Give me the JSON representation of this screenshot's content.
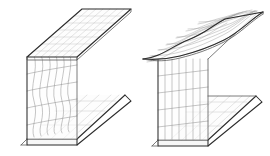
{
  "figure": {
    "background_color": "#ffffff",
    "outline_color": "#2b2b2b",
    "mesh_color": "#9d9d9d",
    "width": 270,
    "height": 156,
    "panel_count": 2
  },
  "panels": [
    {
      "id": "left-beam",
      "label": "Web local buckling mode",
      "caption": "",
      "section_type": "I-beam (wide flange)",
      "projection": "isometric",
      "deformed_part": "web",
      "undeformed_parts": "top flange, bottom flange",
      "mesh": {
        "columns": 7,
        "rows": 4,
        "flange_columns": 7,
        "flange_rows": 3
      },
      "geometry": {
        "top_flange": [
          [
            27,
            57
          ],
          [
            82,
            9
          ],
          [
            131,
            9
          ],
          [
            77,
            57
          ]
        ],
        "top_flange_front_edge": [
          [
            27,
            57
          ],
          [
            77,
            57
          ]
        ],
        "bottom_flange": [
          [
            21,
            145
          ],
          [
            27,
            139
          ],
          [
            77,
            139
          ],
          [
            125,
            95
          ],
          [
            131,
            101
          ],
          [
            77,
            145
          ]
        ],
        "web_top_near": [
          27,
          57
        ],
        "web_bottom_near": [
          27,
          139
        ],
        "web_top_far": [
          77,
          57
        ],
        "web_bottom_far": [
          77,
          139
        ],
        "web_far_top": [
          125,
          10
        ],
        "web_far_bottom": [
          125,
          95
        ]
      },
      "buckling": {
        "amplitude_px": 6,
        "half_waves": 2,
        "direction": "out-of-plane (horizontal)"
      }
    },
    {
      "id": "right-beam",
      "label": "Flange local buckling mode",
      "caption": "",
      "section_type": "I-beam (wide flange)",
      "projection": "isometric",
      "deformed_part": "top flange",
      "undeformed_parts": "web, bottom flange",
      "mesh": {
        "columns": 7,
        "rows": 4,
        "flange_columns": 7,
        "flange_rows": 3
      },
      "geometry": {
        "top_flange": [
          [
            143,
            59
          ],
          [
            197,
            12
          ],
          [
            263,
            12
          ],
          [
            209,
            59
          ]
        ],
        "bottom_flange": [
          [
            152,
            146
          ],
          [
            158,
            140
          ],
          [
            208,
            140
          ],
          [
            256,
            96
          ],
          [
            262,
            102
          ],
          [
            208,
            146
          ]
        ],
        "web_top_near": [
          158,
          59
        ],
        "web_bottom_near": [
          158,
          140
        ],
        "web_top_far": [
          208,
          59
        ],
        "web_bottom_far": [
          208,
          140
        ],
        "web_far_top": [
          256,
          14
        ],
        "web_far_bottom": [
          256,
          96
        ]
      },
      "buckling": {
        "amplitude_px": 10,
        "half_waves": 2,
        "direction": "out-of-plane (vertical, flange tip)"
      }
    }
  ]
}
